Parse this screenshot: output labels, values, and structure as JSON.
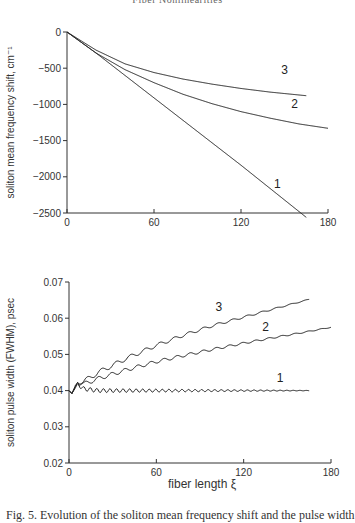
{
  "page": {
    "header": "Fiber Nonlinearities",
    "caption": "Fig. 5.  Evolution of the soliton mean frequency shift and the pulse width"
  },
  "chart_data": [
    {
      "type": "line",
      "title": "",
      "xlabel": "",
      "ylabel": "soliton mean frequency shift, cm⁻¹",
      "xlim": [
        0,
        180
      ],
      "ylim": [
        -2500,
        0
      ],
      "xticks": [
        0,
        60,
        120,
        180
      ],
      "xtick_labels": [
        "0",
        "60",
        "120",
        "180"
      ],
      "yticks": [
        0,
        -500,
        -1000,
        -1500,
        -2000,
        -2500
      ],
      "ytick_labels": [
        "0",
        "-500",
        "-1000",
        "-1500",
        "-2000",
        "-2500"
      ],
      "grid": false,
      "legend": "inline curve labels",
      "series": [
        {
          "name": "1",
          "x": [
            0,
            20,
            40,
            60,
            80,
            100,
            120,
            140,
            160,
            165
          ],
          "y": [
            0,
            -290,
            -600,
            -910,
            -1220,
            -1530,
            -1840,
            -2160,
            -2480,
            -2560
          ],
          "label_pos": [
            145,
            -2160
          ]
        },
        {
          "name": "2",
          "x": [
            0,
            20,
            40,
            60,
            80,
            100,
            120,
            140,
            160,
            180
          ],
          "y": [
            0,
            -290,
            -520,
            -700,
            -860,
            -990,
            -1100,
            -1190,
            -1270,
            -1330
          ],
          "label_pos": [
            157,
            -1050
          ]
        },
        {
          "name": "3",
          "x": [
            0,
            20,
            40,
            60,
            80,
            100,
            120,
            140,
            160,
            165
          ],
          "y": [
            0,
            -250,
            -440,
            -560,
            -650,
            -720,
            -780,
            -830,
            -870,
            -880
          ],
          "label_pos": [
            150,
            -580
          ]
        }
      ]
    },
    {
      "type": "line",
      "title": "",
      "xlabel": "fiber length ξ",
      "ylabel": "soliton pulse width (FWHM), psec",
      "xlim": [
        0,
        180
      ],
      "ylim": [
        0.02,
        0.07
      ],
      "xticks": [
        0,
        60,
        120,
        180
      ],
      "xtick_labels": [
        "0",
        "60",
        "120",
        "180"
      ],
      "yticks": [
        0.07,
        0.06,
        0.05,
        0.04,
        0.03,
        0.02
      ],
      "ytick_labels": [
        "0.07",
        "0.06",
        "0.05",
        "0.04",
        "0.03",
        "0.02"
      ],
      "grid": false,
      "legend": "inline curve labels",
      "series": [
        {
          "name": "1",
          "x": [
            0,
            2,
            4,
            6,
            10,
            20,
            40,
            60,
            80,
            100,
            120,
            140,
            165
          ],
          "y": [
            0.04,
            0.0392,
            0.0405,
            0.0418,
            0.0405,
            0.04,
            0.04,
            0.04,
            0.04,
            0.04,
            0.04,
            0.04,
            0.04
          ],
          "oscillation": {
            "amp": [
              0.0006,
              5e-05
            ],
            "period": 4.5
          },
          "label_pos": [
            145,
            0.0425
          ]
        },
        {
          "name": "2",
          "x": [
            0,
            2,
            4,
            6,
            10,
            20,
            40,
            60,
            80,
            100,
            120,
            140,
            160,
            180
          ],
          "y": [
            0.04,
            0.0392,
            0.0408,
            0.0422,
            0.0418,
            0.0433,
            0.0458,
            0.048,
            0.0498,
            0.0515,
            0.0531,
            0.0546,
            0.056,
            0.0575
          ],
          "oscillation": {
            "amp": [
              0.0006,
              0.0001
            ],
            "period": 9
          },
          "label_pos": [
            135,
            0.0565
          ]
        },
        {
          "name": "3",
          "x": [
            0,
            2,
            4,
            6,
            10,
            20,
            40,
            60,
            80,
            100,
            120,
            140,
            165
          ],
          "y": [
            0.04,
            0.0392,
            0.041,
            0.0425,
            0.0425,
            0.045,
            0.049,
            0.0525,
            0.0555,
            0.0581,
            0.0603,
            0.0625,
            0.0652
          ],
          "oscillation": {
            "amp": [
              0.0007,
              0.0001
            ],
            "period": 10
          },
          "label_pos": [
            103,
            0.062
          ]
        }
      ]
    }
  ],
  "layout": {
    "charts": [
      {
        "x0": 67,
        "x1": 328,
        "y0": 32,
        "y1": 213
      },
      {
        "x0": 69,
        "x1": 331,
        "y0": 282,
        "y1": 463
      }
    ]
  }
}
